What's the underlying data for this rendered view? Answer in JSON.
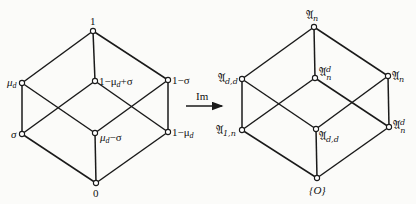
{
  "diagram": {
    "type": "lattice-map",
    "left_lattice": {
      "nodes": [
        {
          "id": "top",
          "label": "1",
          "x": 93,
          "y": 31
        },
        {
          "id": "mu_d",
          "label": "μ",
          "sub": "d",
          "x": 22,
          "y": 83
        },
        {
          "id": "one_minus_mu_plus_sigma",
          "label": "1−μ",
          "sub": "d",
          "suffix": "+σ",
          "x": 95,
          "y": 81
        },
        {
          "id": "one_minus_sigma",
          "label": "1−σ",
          "x": 168,
          "y": 80
        },
        {
          "id": "sigma",
          "label": "σ",
          "x": 22,
          "y": 134
        },
        {
          "id": "mu_minus_sigma",
          "label": "μ",
          "sub": "d",
          "suffix": "−σ",
          "x": 95,
          "y": 133
        },
        {
          "id": "one_minus_mu",
          "label": "1−μ",
          "sub": "d",
          "x": 168,
          "y": 132
        },
        {
          "id": "bottom",
          "label": "0",
          "x": 96,
          "y": 183
        }
      ],
      "edges": [
        [
          "top",
          "mu_d"
        ],
        [
          "top",
          "one_minus_mu_plus_sigma"
        ],
        [
          "top",
          "one_minus_sigma"
        ],
        [
          "mu_d",
          "sigma"
        ],
        [
          "mu_d",
          "mu_minus_sigma"
        ],
        [
          "one_minus_mu_plus_sigma",
          "sigma"
        ],
        [
          "one_minus_mu_plus_sigma",
          "one_minus_mu"
        ],
        [
          "one_minus_sigma",
          "mu_minus_sigma"
        ],
        [
          "one_minus_sigma",
          "one_minus_mu"
        ],
        [
          "sigma",
          "bottom"
        ],
        [
          "mu_minus_sigma",
          "bottom"
        ],
        [
          "one_minus_mu",
          "bottom"
        ]
      ]
    },
    "arrow": {
      "label": "Im",
      "x1": 186,
      "x2": 223,
      "y": 105
    },
    "right_lattice": {
      "nodes": [
        {
          "id": "A_n_top",
          "label": "𝔄",
          "sub": "n",
          "x": 314,
          "y": 27
        },
        {
          "id": "A_dd_left",
          "label": "𝔄",
          "sub": "d,d",
          "x": 242,
          "y": 79
        },
        {
          "id": "A_n_d_center",
          "label": "𝔄",
          "sub": "n",
          "sup": "d",
          "x": 315,
          "y": 78
        },
        {
          "id": "A_n_right",
          "label": "𝔄",
          "sub": "n",
          "x": 388,
          "y": 76
        },
        {
          "id": "A_1n",
          "label": "𝔄",
          "sub": "1,n",
          "x": 242,
          "y": 130
        },
        {
          "id": "A_dd_center",
          "label": "𝔄",
          "sub": "d,d",
          "x": 316,
          "y": 129
        },
        {
          "id": "A_n_d_right",
          "label": "𝔄",
          "sub": "n",
          "sup": "d",
          "x": 389,
          "y": 127
        },
        {
          "id": "O",
          "label": "{O}",
          "x": 317,
          "y": 178
        }
      ],
      "edges": [
        [
          "A_n_top",
          "A_dd_left"
        ],
        [
          "A_n_top",
          "A_n_d_center"
        ],
        [
          "A_n_top",
          "A_n_right"
        ],
        [
          "A_dd_left",
          "A_1n"
        ],
        [
          "A_dd_left",
          "A_dd_center"
        ],
        [
          "A_n_d_center",
          "A_1n"
        ],
        [
          "A_n_d_center",
          "A_n_d_right"
        ],
        [
          "A_n_right",
          "A_dd_center"
        ],
        [
          "A_n_right",
          "A_n_d_right"
        ],
        [
          "A_1n",
          "O"
        ],
        [
          "A_dd_center",
          "O"
        ],
        [
          "A_n_d_right",
          "O"
        ]
      ]
    }
  },
  "labels": {
    "l_top": "1",
    "l_mu": "μ",
    "l_mu_sub": "d",
    "l_c1": "1−μ",
    "l_c1_sub": "d",
    "l_c1_suf": "+σ",
    "l_r1": "1−σ",
    "l_sigma": "σ",
    "l_c2": "μ",
    "l_c2_sub": "d",
    "l_c2_suf": "−σ",
    "l_r2": "1−μ",
    "l_r2_sub": "d",
    "l_bottom": "0",
    "arrow": "Im",
    "r_top": "𝔄",
    "r_top_sub": "n",
    "r_l1": "𝔄",
    "r_l1_sub": "d,d",
    "r_c1": "𝔄",
    "r_c1_sub": "n",
    "r_c1_sup": "d",
    "r_r1": "𝔄",
    "r_r1_sub": "n",
    "r_l2": "𝔄",
    "r_l2_sub": "1,n",
    "r_c2": "𝔄",
    "r_c2_sub": "d,d",
    "r_r2": "𝔄",
    "r_r2_sub": "n",
    "r_r2_sup": "d",
    "r_bottom": "{O}"
  }
}
